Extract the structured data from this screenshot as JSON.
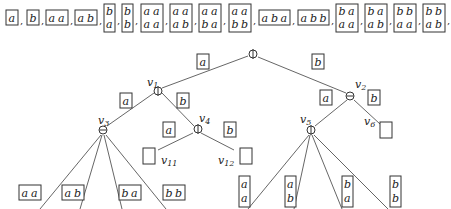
{
  "sequence": {
    "items": [
      {
        "rows": [
          [
            "a"
          ]
        ]
      },
      {
        "rows": [
          [
            "b"
          ]
        ]
      },
      {
        "rows": [
          [
            "a",
            "a"
          ]
        ]
      },
      {
        "rows": [
          [
            "a",
            "b"
          ]
        ]
      },
      {
        "rows": [
          [
            "b"
          ],
          [
            "a"
          ]
        ]
      },
      {
        "rows": [
          [
            "b"
          ],
          [
            "b"
          ]
        ]
      },
      {
        "rows": [
          [
            "a",
            "a"
          ],
          [
            "a",
            "a"
          ]
        ]
      },
      {
        "rows": [
          [
            "a",
            "a"
          ],
          [
            "a",
            "b"
          ]
        ]
      },
      {
        "rows": [
          [
            "a",
            "a"
          ],
          [
            "b",
            "a"
          ]
        ]
      },
      {
        "rows": [
          [
            "a",
            "a"
          ],
          [
            "b",
            "b"
          ]
        ]
      },
      {
        "rows": [
          [
            "a",
            "b",
            "a"
          ]
        ]
      },
      {
        "rows": [
          [
            "a",
            "b",
            "b"
          ]
        ]
      },
      {
        "rows": [
          [
            "b",
            "a"
          ],
          [
            "a",
            "a"
          ]
        ]
      },
      {
        "rows": [
          [
            "b",
            "a"
          ],
          [
            "a",
            "b"
          ]
        ]
      },
      {
        "rows": [
          [
            "b",
            "b"
          ],
          [
            "a",
            "a"
          ]
        ]
      },
      {
        "rows": [
          [
            "b",
            "b"
          ],
          [
            "a",
            "b"
          ]
        ]
      }
    ],
    "separator": ","
  },
  "tree": {
    "nodes": {
      "root": {
        "label": "",
        "op": "oplus"
      },
      "v1": {
        "label": "v1",
        "sub": "1",
        "op": "oplus"
      },
      "v2": {
        "label": "v2",
        "sub": "2",
        "op": "ominus"
      },
      "v3": {
        "label": "v3",
        "sub": "3",
        "op": "ominus"
      },
      "v4": {
        "label": "v4",
        "sub": "4",
        "op": "oplus"
      },
      "v5": {
        "label": "v5",
        "sub": "5",
        "op": "oplus"
      },
      "v6": {
        "label": "v6",
        "sub": "6",
        "op": "empty"
      },
      "v11": {
        "label": "v11",
        "sub": "11",
        "op": "empty"
      },
      "v12": {
        "label": "v12",
        "sub": "12",
        "op": "empty"
      }
    },
    "edge_labels": {
      "root_v1": "a",
      "root_v2": "b",
      "v1_v3": "a",
      "v1_v4": "b",
      "v2_v5": "a",
      "v2_v6": "b",
      "v4_v11": "a",
      "v4_v12": "b"
    },
    "v3_children": [
      {
        "rows": [
          [
            "a",
            "a"
          ]
        ]
      },
      {
        "rows": [
          [
            "a",
            "b"
          ]
        ]
      },
      {
        "rows": [
          [
            "b",
            "a"
          ]
        ]
      },
      {
        "rows": [
          [
            "b",
            "b"
          ]
        ]
      }
    ],
    "v5_children": [
      {
        "rows": [
          [
            "a"
          ],
          [
            "a"
          ]
        ]
      },
      {
        "rows": [
          [
            "a"
          ],
          [
            "b"
          ]
        ]
      },
      {
        "rows": [
          [
            "b"
          ],
          [
            "a"
          ]
        ]
      },
      {
        "rows": [
          [
            "b"
          ],
          [
            "b"
          ]
        ]
      }
    ]
  }
}
